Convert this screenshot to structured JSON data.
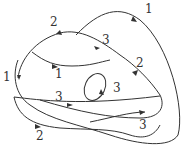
{
  "diagram": {
    "type": "curve-diagram",
    "labels": [
      {
        "id": "l1-top",
        "text": "1",
        "x": 145,
        "y": 13
      },
      {
        "id": "l2-topleft",
        "text": "2",
        "x": 50,
        "y": 26
      },
      {
        "id": "l3-upper",
        "text": "3",
        "x": 102,
        "y": 44
      },
      {
        "id": "l2-right",
        "text": "2",
        "x": 136,
        "y": 67
      },
      {
        "id": "l1-inner",
        "text": "1",
        "x": 55,
        "y": 78
      },
      {
        "id": "l1-left",
        "text": "1",
        "x": 3,
        "y": 81
      },
      {
        "id": "l3-loop",
        "text": "3",
        "x": 113,
        "y": 92
      },
      {
        "id": "l3-middle",
        "text": "3",
        "x": 55,
        "y": 101
      },
      {
        "id": "l2-bottom",
        "text": "2",
        "x": 36,
        "y": 140
      },
      {
        "id": "l3-bottom",
        "text": "3",
        "x": 139,
        "y": 129
      }
    ]
  }
}
